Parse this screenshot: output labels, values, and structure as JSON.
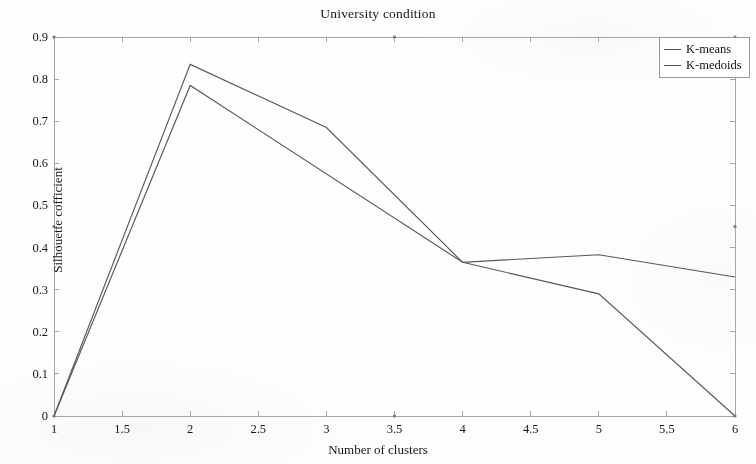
{
  "chart_data": {
    "type": "line",
    "title": "University condition",
    "xlabel": "Number of clusters",
    "ylabel": "Silhouette cofficient",
    "xlim": [
      1,
      6
    ],
    "ylim": [
      0,
      0.9
    ],
    "xticks": [
      "1",
      "1.5",
      "2",
      "2.5",
      "3",
      "3.5",
      "4",
      "4.5",
      "5",
      "5.5",
      "6"
    ],
    "xtick_values": [
      1,
      1.5,
      2,
      2.5,
      3,
      3.5,
      4,
      4.5,
      5,
      5.5,
      6
    ],
    "yticks": [
      "0",
      "0.1",
      "0.2",
      "0.3",
      "0.4",
      "0.5",
      "0.6",
      "0.7",
      "0.8",
      "0.9"
    ],
    "ytick_values": [
      0,
      0.1,
      0.2,
      0.3,
      0.4,
      0.5,
      0.6,
      0.7,
      0.8,
      0.9
    ],
    "grid": false,
    "legend_position": "top-right",
    "series": [
      {
        "name": "K-means",
        "color": "#585858",
        "x": [
          1,
          2,
          3,
          4,
          5,
          6
        ],
        "values": [
          0,
          0.835,
          0.685,
          0.365,
          0.383,
          0.33
        ]
      },
      {
        "name": "K-medoids",
        "color": "#585858",
        "x": [
          1,
          2,
          4,
          5,
          6
        ],
        "values": [
          0,
          0.785,
          0.365,
          0.29,
          0
        ]
      }
    ]
  },
  "legend": {
    "entries": [
      {
        "label": "K-means"
      },
      {
        "label": "K-medoids"
      }
    ]
  }
}
